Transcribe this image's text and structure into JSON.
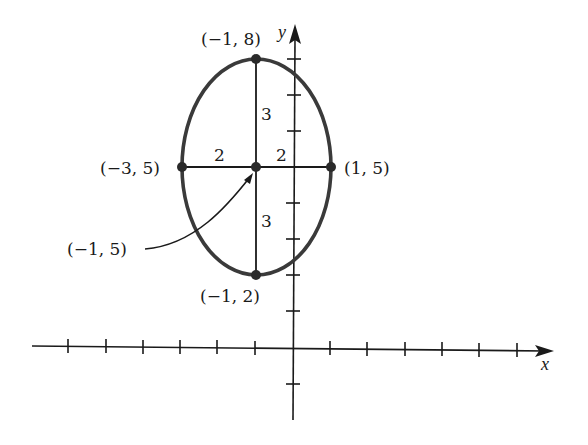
{
  "diagram": {
    "type": "ellipse-on-coordinate-plane",
    "axes": {
      "x_label": "x",
      "y_label": "y",
      "x_ticks_negative": 6,
      "x_ticks_positive": 6,
      "y_ticks_positive": 8,
      "y_ticks_negative": 1
    },
    "center": {
      "label": "(−1, 5)",
      "x": -1,
      "y": 5
    },
    "vertices": [
      {
        "id": "top",
        "label": "(−1, 8)",
        "x": -1,
        "y": 8
      },
      {
        "id": "bottom",
        "label": "(−1, 2)",
        "x": -1,
        "y": 2
      },
      {
        "id": "left",
        "label": "(−3, 5)",
        "x": -3,
        "y": 5
      },
      {
        "id": "right",
        "label": "(1, 5)",
        "x": 1,
        "y": 5
      }
    ],
    "segment_labels": {
      "upper": "3",
      "lower": "3",
      "left": "2",
      "right": "2"
    },
    "colors": {
      "ellipse_stroke": "#3a3a3a",
      "axis": "#1a1a1a",
      "point": "#2a2a2a"
    }
  }
}
